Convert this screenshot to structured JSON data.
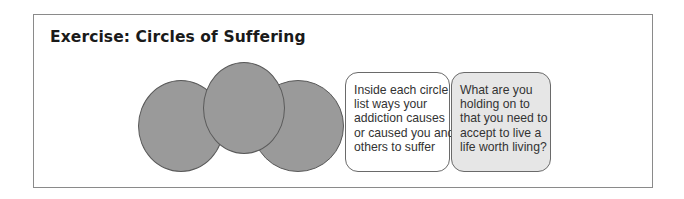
{
  "title": "Exercise: Circles of Suffering",
  "circles": [
    {
      "label": "circle-1"
    },
    {
      "label": "circle-2"
    },
    {
      "label": "circle-3"
    }
  ],
  "boxes": [
    {
      "lines": [
        "Inside each circle",
        "list ways your",
        "addiction causes",
        "or caused you and",
        "others to suffer"
      ],
      "background": "#ffffff"
    },
    {
      "lines": [
        "What are you",
        "holding on to",
        "that you need to",
        "accept to live a",
        "life worth living?"
      ],
      "background": "#e6e6e6"
    }
  ],
  "colors": {
    "circle_fill": "#9a9a9a",
    "frame_border": "#8a8a8a"
  }
}
